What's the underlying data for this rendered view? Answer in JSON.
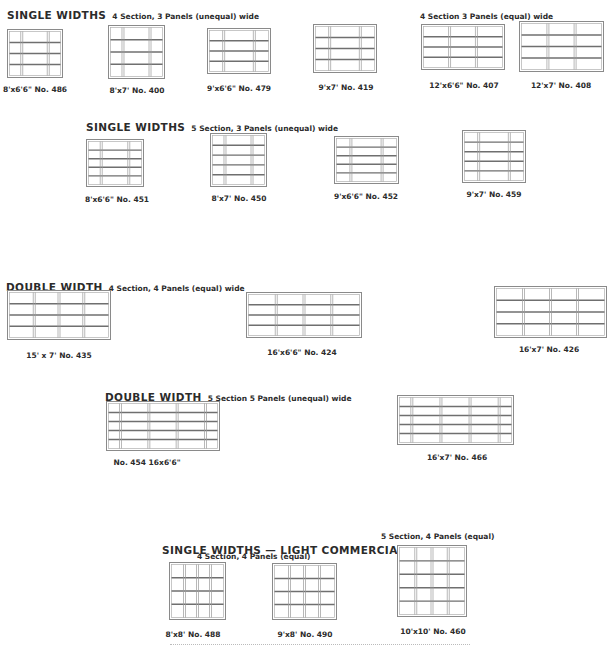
{
  "headers": [
    {
      "id": "h1",
      "title": "SINGLE WIDTHS",
      "detail": "4 Section, 3 Panels   (unequal) wide",
      "x": 7,
      "y": 4
    },
    {
      "id": "h2",
      "title": "",
      "detail": "4 Section  3 Panels (equal) wide",
      "x": 420,
      "y": 4
    },
    {
      "id": "h3",
      "title": "SINGLE WIDTHS",
      "detail": "5 Section, 3 Panels  (unequal) wide",
      "x": 86,
      "y": 116
    },
    {
      "id": "h4",
      "title": "DOUBLE WIDTH",
      "detail": "4 Section, 4 Panels  (equal) wide",
      "x": 6,
      "y": 276
    },
    {
      "id": "h5",
      "title": "DOUBLE WIDTH",
      "detail": "5 Section   5 Panels (unequal) wide",
      "x": 105,
      "y": 386
    },
    {
      "id": "h6",
      "title": "SINGLE WIDTHS — LIGHT COMMERCIAL",
      "detail": "",
      "x": 162,
      "y": 539
    }
  ],
  "subheaders": [
    {
      "id": "s1",
      "text": "4 Section, 4 Panels    (equal)",
      "x": 197,
      "y": 552
    },
    {
      "id": "s2",
      "text": "5 Section, 4 Panels  (equal)",
      "x": 381,
      "y": 532
    }
  ],
  "doors": [
    {
      "id": "486",
      "caption": "8'x6'6\" No. 486",
      "x": 7,
      "y": 29,
      "w": 56,
      "h": 49,
      "cols": [
        0.24,
        0.52,
        0.24
      ],
      "rows": 4,
      "capx": 35,
      "capy": 85
    },
    {
      "id": "400",
      "caption": "8'x7' No. 400",
      "x": 108,
      "y": 25,
      "w": 57,
      "h": 54,
      "cols": [
        0.24,
        0.52,
        0.24
      ],
      "rows": 4,
      "capx": 137,
      "capy": 86
    },
    {
      "id": "479",
      "caption": "9'x6'6\" No. 479",
      "x": 207,
      "y": 28,
      "w": 64,
      "h": 46,
      "cols": [
        0.24,
        0.52,
        0.24
      ],
      "rows": 4,
      "capx": 239,
      "capy": 84
    },
    {
      "id": "419",
      "caption": "9'x7' No. 419",
      "x": 313,
      "y": 24,
      "w": 64,
      "h": 49,
      "cols": [
        0.24,
        0.52,
        0.24
      ],
      "rows": 4,
      "capx": 346,
      "capy": 83
    },
    {
      "id": "407",
      "caption": "12'x6'6\" No. 407",
      "x": 421,
      "y": 24,
      "w": 84,
      "h": 46,
      "cols": [
        0.33,
        0.34,
        0.33
      ],
      "rows": 4,
      "capx": 464,
      "capy": 81
    },
    {
      "id": "408",
      "caption": "12'x7' No. 408",
      "x": 519,
      "y": 21,
      "w": 85,
      "h": 51,
      "cols": [
        0.33,
        0.34,
        0.33
      ],
      "rows": 4,
      "capx": 561,
      "capy": 81
    },
    {
      "id": "451",
      "caption": "8'x6'6\" No. 451",
      "x": 86,
      "y": 139,
      "w": 58,
      "h": 48,
      "cols": [
        0.24,
        0.52,
        0.24
      ],
      "rows": 5,
      "capx": 117,
      "capy": 195
    },
    {
      "id": "450",
      "caption": "8'x7' No. 450",
      "x": 210,
      "y": 133,
      "w": 57,
      "h": 54,
      "cols": [
        0.24,
        0.52,
        0.24
      ],
      "rows": 5,
      "capx": 239,
      "capy": 194
    },
    {
      "id": "452",
      "caption": "9'x6'6\" No. 452",
      "x": 334,
      "y": 136,
      "w": 65,
      "h": 48,
      "cols": [
        0.24,
        0.52,
        0.24
      ],
      "rows": 5,
      "capx": 366,
      "capy": 192
    },
    {
      "id": "459",
      "caption": "9'x7' No. 459",
      "x": 462,
      "y": 130,
      "w": 64,
      "h": 53,
      "cols": [
        0.24,
        0.52,
        0.24
      ],
      "rows": 5,
      "capx": 494,
      "capy": 190
    },
    {
      "id": "435",
      "caption": "15' x 7' No. 435",
      "x": 7,
      "y": 290,
      "w": 104,
      "h": 50,
      "cols": [
        0.25,
        0.25,
        0.25,
        0.25
      ],
      "rows": 4,
      "capx": 59,
      "capy": 351
    },
    {
      "id": "424",
      "caption": "16'x6'6\" No. 424",
      "x": 246,
      "y": 292,
      "w": 116,
      "h": 46,
      "cols": [
        0.25,
        0.25,
        0.25,
        0.25
      ],
      "rows": 4,
      "capx": 302,
      "capy": 348
    },
    {
      "id": "426",
      "caption": "16'x7' No. 426",
      "x": 494,
      "y": 286,
      "w": 113,
      "h": 52,
      "cols": [
        0.25,
        0.25,
        0.25,
        0.25
      ],
      "rows": 4,
      "capx": 549,
      "capy": 345
    },
    {
      "id": "454",
      "caption": "No. 454 16x6'6\"",
      "x": 106,
      "y": 401,
      "w": 114,
      "h": 50,
      "cols": [
        0.11,
        0.26,
        0.26,
        0.26,
        0.11
      ],
      "rows": 5,
      "capx": 147,
      "capy": 458
    },
    {
      "id": "466",
      "caption": "16'x7' No. 466",
      "x": 397,
      "y": 395,
      "w": 117,
      "h": 50,
      "cols": [
        0.11,
        0.26,
        0.26,
        0.26,
        0.11
      ],
      "rows": 5,
      "capx": 457,
      "capy": 453
    },
    {
      "id": "488",
      "caption": "8'x8' No. 488",
      "x": 169,
      "y": 562,
      "w": 57,
      "h": 58,
      "cols": [
        0.25,
        0.25,
        0.25,
        0.25
      ],
      "rows": 4,
      "capx": 193,
      "capy": 630
    },
    {
      "id": "490",
      "caption": "9'x8' No. 490",
      "x": 272,
      "y": 563,
      "w": 65,
      "h": 57,
      "cols": [
        0.25,
        0.25,
        0.25,
        0.25
      ],
      "rows": 4,
      "capx": 305,
      "capy": 630
    },
    {
      "id": "460",
      "caption": "10'x10' No. 460",
      "x": 397,
      "y": 545,
      "w": 70,
      "h": 72,
      "cols": [
        0.25,
        0.25,
        0.25,
        0.25
      ],
      "rows": 5,
      "capx": 433,
      "capy": 627
    }
  ],
  "colors": {
    "frame": "#8a8a8a",
    "rail": "#6f6f6f",
    "text": "#2b2b2b",
    "bg": "#ffffff"
  }
}
